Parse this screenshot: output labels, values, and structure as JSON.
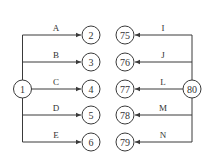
{
  "diagram": {
    "left_group": {
      "source": {
        "label": "1"
      },
      "edges": [
        {
          "label": "A",
          "target": "2"
        },
        {
          "label": "B",
          "target": "3"
        },
        {
          "label": "C",
          "target": "4"
        },
        {
          "label": "D",
          "target": "5"
        },
        {
          "label": "E",
          "target": "6"
        }
      ]
    },
    "right_group": {
      "source": {
        "label": "80"
      },
      "edges": [
        {
          "label": "I",
          "target": "75"
        },
        {
          "label": "J",
          "target": "76"
        },
        {
          "label": "L",
          "target": "77"
        },
        {
          "label": "M",
          "target": "78"
        },
        {
          "label": "N",
          "target": "79"
        }
      ]
    },
    "colors": {
      "line": "#3a3a3a",
      "background": "#ffffff"
    }
  }
}
